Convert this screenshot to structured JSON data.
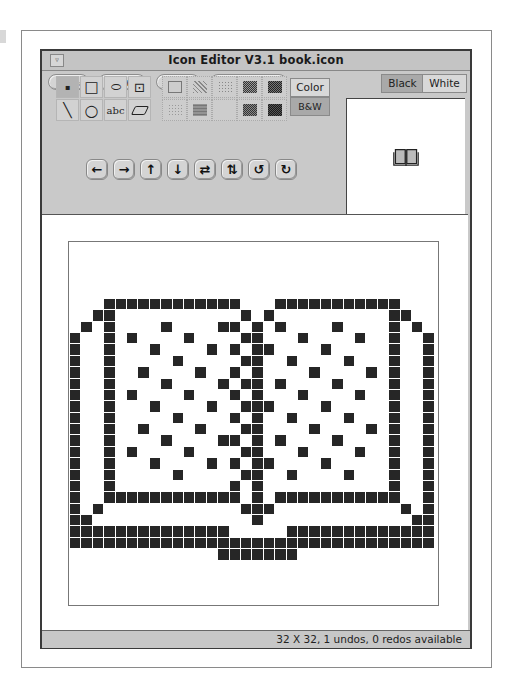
{
  "window": {
    "title": "Icon Editor V3.1 book.icon",
    "window_menu_glyph": "▿"
  },
  "menubar": {
    "items": [
      {
        "label": "File",
        "arrow": "▿"
      },
      {
        "label": "View",
        "arrow": "▿"
      },
      {
        "label": "Edit",
        "arrow": "▿"
      },
      {
        "label": "Properties",
        "arrow": "▿"
      }
    ],
    "fg_bg_toggle": {
      "black": "Black",
      "white": "White",
      "selected": "Black"
    }
  },
  "tools": [
    {
      "name": "point-tool",
      "glyph": "▪",
      "selected": true
    },
    {
      "name": "rectangle-tool",
      "glyph": "□"
    },
    {
      "name": "ellipse-tool",
      "glyph": "⬭"
    },
    {
      "name": "selection-tool",
      "glyph": "⊡"
    },
    {
      "name": "line-tool",
      "glyph": "╲"
    },
    {
      "name": "circle-tool",
      "glyph": "○"
    },
    {
      "name": "text-tool",
      "glyph": "abc"
    },
    {
      "name": "eraser-tool",
      "glyph": "⌫"
    }
  ],
  "fill_patterns": [
    "none",
    "light-dots",
    "medium-dots",
    "dense-grid",
    "dense-check",
    "fine-dots",
    "grid-dots",
    "blank",
    "dark-check",
    "darkest"
  ],
  "color_mode": {
    "color": "Color",
    "bw": "B&W",
    "selected": "B&W"
  },
  "transform_buttons": [
    {
      "name": "shift-left",
      "glyph": "🡐"
    },
    {
      "name": "shift-right",
      "glyph": "🡒"
    },
    {
      "name": "shift-up",
      "glyph": "🡑"
    },
    {
      "name": "shift-down",
      "glyph": "🡓"
    },
    {
      "name": "flip-horizontal",
      "glyph": "⇄"
    },
    {
      "name": "flip-vertical",
      "glyph": "⇅"
    },
    {
      "name": "rotate-left",
      "glyph": "↺"
    },
    {
      "name": "rotate-right",
      "glyph": "↻"
    }
  ],
  "preview": {
    "glyph": "📖"
  },
  "canvas": {
    "cols": 32,
    "rows": 32,
    "pixels": {
      "5": [
        [
          3,
          14
        ],
        [
          18,
          28
        ]
      ],
      "6": [
        [
          2,
          3
        ],
        [
          15,
          15
        ],
        [
          17,
          17
        ],
        [
          28,
          29
        ]
      ],
      "7": [
        [
          1,
          1
        ],
        [
          3,
          3
        ],
        [
          8,
          8
        ],
        [
          13,
          14
        ],
        [
          16,
          16
        ],
        [
          18,
          18
        ],
        [
          23,
          23
        ],
        [
          28,
          28
        ],
        [
          30,
          30
        ]
      ],
      "8": [
        [
          0,
          0
        ],
        [
          3,
          3
        ],
        [
          5,
          5
        ],
        [
          10,
          10
        ],
        [
          15,
          16
        ],
        [
          20,
          20
        ],
        [
          25,
          25
        ],
        [
          28,
          28
        ],
        [
          31,
          31
        ]
      ],
      "9": [
        [
          0,
          0
        ],
        [
          3,
          3
        ],
        [
          7,
          7
        ],
        [
          12,
          12
        ],
        [
          14,
          14
        ],
        [
          16,
          17
        ],
        [
          22,
          22
        ],
        [
          28,
          28
        ],
        [
          31,
          31
        ]
      ],
      "10": [
        [
          0,
          0
        ],
        [
          3,
          3
        ],
        [
          9,
          9
        ],
        [
          15,
          16
        ],
        [
          19,
          19
        ],
        [
          24,
          24
        ],
        [
          28,
          28
        ],
        [
          31,
          31
        ]
      ],
      "11": [
        [
          0,
          0
        ],
        [
          3,
          3
        ],
        [
          6,
          6
        ],
        [
          11,
          11
        ],
        [
          14,
          14
        ],
        [
          16,
          16
        ],
        [
          21,
          21
        ],
        [
          26,
          26
        ],
        [
          28,
          28
        ],
        [
          31,
          31
        ]
      ],
      "12": [
        [
          0,
          0
        ],
        [
          3,
          3
        ],
        [
          8,
          8
        ],
        [
          13,
          13
        ],
        [
          15,
          16
        ],
        [
          18,
          18
        ],
        [
          23,
          23
        ],
        [
          28,
          28
        ],
        [
          31,
          31
        ]
      ],
      "13": [
        [
          0,
          0
        ],
        [
          3,
          3
        ],
        [
          5,
          5
        ],
        [
          10,
          10
        ],
        [
          14,
          14
        ],
        [
          16,
          16
        ],
        [
          20,
          20
        ],
        [
          25,
          25
        ],
        [
          28,
          28
        ],
        [
          31,
          31
        ]
      ],
      "14": [
        [
          0,
          0
        ],
        [
          3,
          3
        ],
        [
          7,
          7
        ],
        [
          12,
          12
        ],
        [
          15,
          17
        ],
        [
          22,
          22
        ],
        [
          28,
          28
        ],
        [
          31,
          31
        ]
      ],
      "15": [
        [
          0,
          0
        ],
        [
          3,
          3
        ],
        [
          9,
          9
        ],
        [
          14,
          14
        ],
        [
          16,
          16
        ],
        [
          19,
          19
        ],
        [
          24,
          24
        ],
        [
          28,
          28
        ],
        [
          31,
          31
        ]
      ],
      "16": [
        [
          0,
          0
        ],
        [
          3,
          3
        ],
        [
          6,
          6
        ],
        [
          11,
          11
        ],
        [
          15,
          16
        ],
        [
          21,
          21
        ],
        [
          26,
          26
        ],
        [
          28,
          28
        ],
        [
          31,
          31
        ]
      ],
      "17": [
        [
          0,
          0
        ],
        [
          3,
          3
        ],
        [
          8,
          8
        ],
        [
          13,
          14
        ],
        [
          16,
          16
        ],
        [
          18,
          18
        ],
        [
          23,
          23
        ],
        [
          28,
          28
        ],
        [
          31,
          31
        ]
      ],
      "18": [
        [
          0,
          0
        ],
        [
          3,
          3
        ],
        [
          5,
          5
        ],
        [
          10,
          10
        ],
        [
          15,
          16
        ],
        [
          20,
          20
        ],
        [
          25,
          25
        ],
        [
          28,
          28
        ],
        [
          31,
          31
        ]
      ],
      "19": [
        [
          0,
          0
        ],
        [
          3,
          3
        ],
        [
          7,
          7
        ],
        [
          12,
          12
        ],
        [
          14,
          14
        ],
        [
          16,
          17
        ],
        [
          22,
          22
        ],
        [
          28,
          28
        ],
        [
          31,
          31
        ]
      ],
      "20": [
        [
          0,
          0
        ],
        [
          3,
          3
        ],
        [
          9,
          9
        ],
        [
          15,
          16
        ],
        [
          19,
          19
        ],
        [
          24,
          24
        ],
        [
          28,
          28
        ],
        [
          31,
          31
        ]
      ],
      "21": [
        [
          0,
          0
        ],
        [
          3,
          3
        ],
        [
          14,
          14
        ],
        [
          16,
          16
        ],
        [
          28,
          28
        ],
        [
          31,
          31
        ]
      ],
      "22": [
        [
          0,
          0
        ],
        [
          3,
          14
        ],
        [
          16,
          16
        ],
        [
          18,
          28
        ],
        [
          31,
          31
        ]
      ],
      "23": [
        [
          0,
          0
        ],
        [
          2,
          2
        ],
        [
          15,
          17
        ],
        [
          29,
          29
        ],
        [
          31,
          31
        ]
      ],
      "24": [
        [
          0,
          1
        ],
        [
          16,
          16
        ],
        [
          30,
          31
        ]
      ],
      "25": [
        [
          0,
          13
        ],
        [
          19,
          31
        ]
      ],
      "26": [
        [
          0,
          31
        ]
      ],
      "27": [
        [
          13,
          19
        ]
      ]
    }
  },
  "status": {
    "text": "32 X 32, 1 undos, 0 redos available"
  }
}
